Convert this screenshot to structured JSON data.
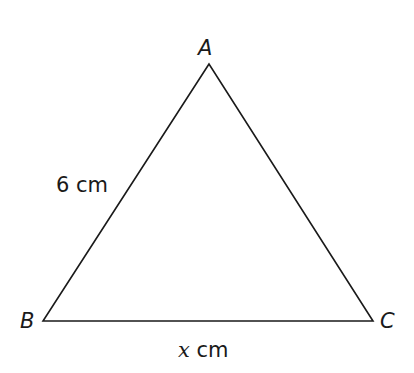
{
  "diagram": {
    "shape": "triangle",
    "vertices": {
      "A": {
        "label": "A",
        "x": 209,
        "y": 64
      },
      "B": {
        "label": "B",
        "x": 43,
        "y": 321
      },
      "C": {
        "label": "C",
        "x": 373,
        "y": 321
      }
    },
    "sides": {
      "AB": {
        "length_label": "6 cm",
        "value": "6",
        "unit": "cm"
      },
      "BC": {
        "length_label": "x cm",
        "variable": "x",
        "unit": "cm"
      }
    },
    "stroke_color": "#1a1a1a"
  }
}
